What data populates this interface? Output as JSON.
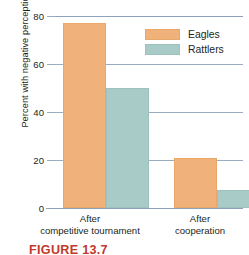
{
  "chart_data": {
    "type": "bar",
    "title": "",
    "xlabel": "",
    "ylabel": "Percent with negative perceptions",
    "categories": [
      "After\ncompetitive tournament",
      "After\ncooperation"
    ],
    "category_lines": [
      [
        "After",
        "competitive tournament"
      ],
      [
        "After",
        "cooperation"
      ]
    ],
    "series": [
      {
        "name": "Eagles",
        "color": "#f0b27a",
        "values": [
          77,
          21
        ]
      },
      {
        "name": "Rattlers",
        "color": "#a8cbc8",
        "values": [
          50,
          7.5
        ]
      }
    ],
    "ylim": [
      0,
      80
    ],
    "yticks": [
      0,
      20,
      40,
      60,
      80
    ],
    "ytick_labels": [
      "0",
      "20",
      "40",
      "60",
      "80"
    ],
    "grid": true,
    "grid_color": "#9badc2",
    "legend_position": "top-right"
  },
  "legend": {
    "items": [
      {
        "label": "Eagles",
        "color": "#f0b27a"
      },
      {
        "label": "Rattlers",
        "color": "#a8cbc8"
      }
    ]
  },
  "axes": {
    "ylabel": "Percent with negative perceptions",
    "ytick_labels": [
      "80",
      "60",
      "40",
      "20",
      "0"
    ]
  },
  "categories": {
    "first": {
      "line1": "After",
      "line2": "competitive tournament"
    },
    "second": {
      "line1": "After",
      "line2": "cooperation"
    }
  },
  "caption": {
    "text": "FIGURE 13.7"
  }
}
